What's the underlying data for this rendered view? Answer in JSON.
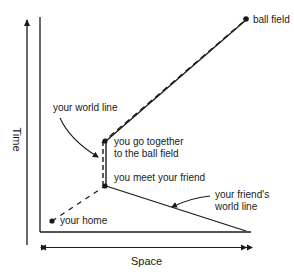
{
  "diagram": {
    "axes": {
      "vertical_label": "Time",
      "horizontal_label": "Space"
    },
    "labels": {
      "ball_field": "ball field",
      "your_world_line": "your world line",
      "go_together_line1": "you go together",
      "go_together_line2": "to the ball field",
      "meet_friend": "you meet your friend",
      "friends_world_line_line1": "your friend's",
      "friends_world_line_line2": "world line",
      "your_home": "your home"
    },
    "events": [
      {
        "name": "your home",
        "x": 52,
        "y": 221
      },
      {
        "name": "you meet your friend",
        "x": 105,
        "y": 186
      },
      {
        "name": "you go together to the ball field",
        "x": 105,
        "y": 141
      },
      {
        "name": "ball field",
        "x": 246,
        "y": 19
      }
    ],
    "colors": {
      "ink": "#1a1a1a",
      "background": "#ffffff"
    }
  }
}
